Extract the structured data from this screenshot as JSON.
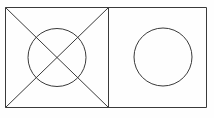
{
  "document": {
    "title": "Geometric line figure",
    "background_color": "#fefefe",
    "canvas_width": 214,
    "canvas_height": 118
  },
  "style": {
    "stroke_color": "#3a3a3a",
    "stroke_width": 1,
    "fill": "none"
  },
  "figure": {
    "type": "line-drawing",
    "shapes": [
      {
        "name": "outer-rectangle",
        "type": "rect",
        "x": 5.5,
        "y": 7.5,
        "width": 201,
        "height": 100
      },
      {
        "name": "vertical-divider",
        "type": "line",
        "x1": 108.5,
        "y1": 7.5,
        "x2": 108.5,
        "y2": 107.5
      },
      {
        "name": "diagonal-top-left-to-bottom-right",
        "type": "line",
        "x1": 5.5,
        "y1": 7.5,
        "x2": 108.5,
        "y2": 107.5
      },
      {
        "name": "diagonal-bottom-left-to-top-right",
        "type": "line",
        "x1": 5.5,
        "y1": 107.5,
        "x2": 108.5,
        "y2": 7.5
      },
      {
        "name": "left-inscribed-circle",
        "type": "circle",
        "cx": 57,
        "cy": 57.5,
        "r": 29
      },
      {
        "name": "right-circle",
        "type": "circle",
        "cx": 163,
        "cy": 57,
        "r": 29
      }
    ]
  }
}
